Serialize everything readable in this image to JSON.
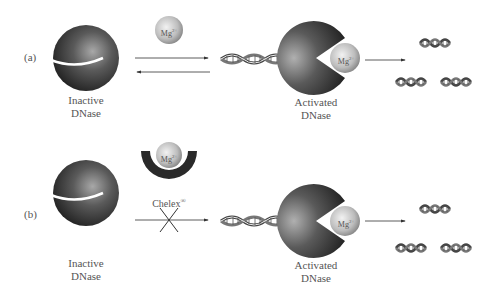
{
  "rows": [
    {
      "panel_label": "(a)",
      "left_enzyme": {
        "line1": "Inactive",
        "line2": "DNase"
      },
      "cofactor": {
        "label": "Mg",
        "charge": "2+"
      },
      "arrow_type": "reversible",
      "right_enzyme": {
        "line1": "Activated",
        "line2": "DNase",
        "cofactor_label": "Mg",
        "cofactor_charge": "2+"
      },
      "product": "DNA fragments"
    },
    {
      "panel_label": "(b)",
      "left_enzyme": {
        "line1": "Inactive",
        "line2": "DNase"
      },
      "chelator": {
        "label": "Chelex",
        "mark": "®",
        "bound_label": "Mg",
        "bound_charge": "2+"
      },
      "arrow_type": "blocked",
      "right_enzyme": {
        "line1": "Activated",
        "line2": "DNase",
        "cofactor_label": "Mg",
        "cofactor_charge": "2+"
      },
      "product": "DNA fragments"
    }
  ],
  "colors": {
    "enzyme_dark": "#2a2a2a",
    "enzyme_light": "#9a9a9a",
    "mg_light": "#eeeeee",
    "mg_dark": "#8a8a8a",
    "text": "#555555",
    "arrow": "#333333"
  }
}
